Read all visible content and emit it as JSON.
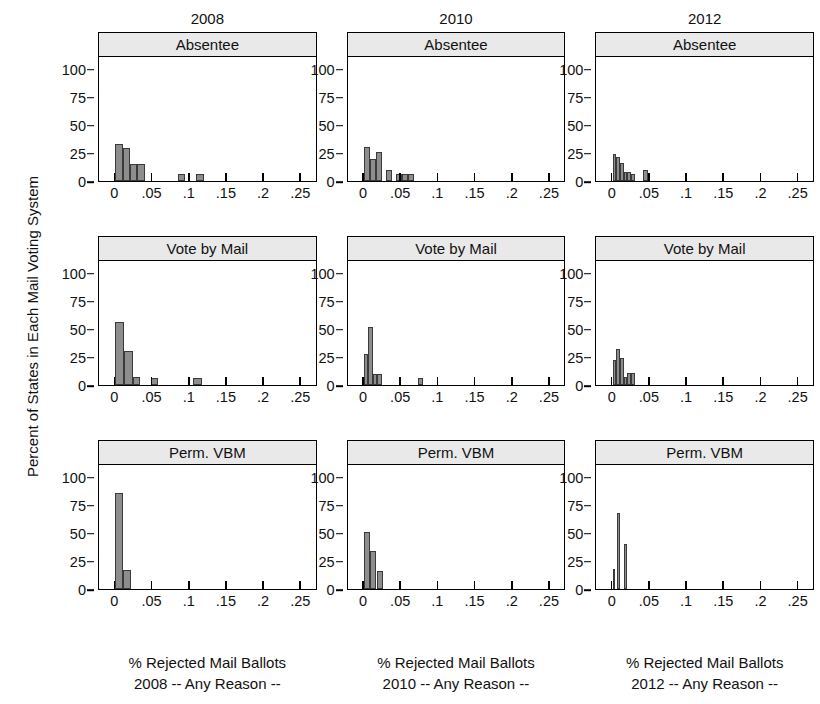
{
  "figure": {
    "ylabel": "Percent of States in Each Mail Voting System",
    "column_titles": [
      "2008",
      "2010",
      "2012"
    ],
    "row_titles": [
      "Absentee",
      "Vote by Mail",
      "Perm. VBM"
    ],
    "x_caption_line1": "% Rejected Mail Ballots",
    "x_captions_line2": [
      "2008 -- Any Reason --",
      "2010 -- Any Reason --",
      "2012 -- Any Reason --"
    ],
    "colors": {
      "bar_fill": "#8d8d8d",
      "bar_edge": "#3a3a3a",
      "strip_fill": "#e9e9e9",
      "axis": "#000000"
    }
  },
  "chart_data": [
    {
      "type": "bar",
      "title": "Absentee",
      "column": "2008",
      "xlabel": "% Rejected Mail Ballots 2008 -- Any Reason --",
      "ylabel": "Percent of States in Each Mail Voting System",
      "xlim": [
        -0.022,
        0.272
      ],
      "ylim": [
        0,
        112
      ],
      "xticks": [
        0,
        0.05,
        0.1,
        0.15,
        0.2,
        0.25
      ],
      "xticklabels": [
        "0",
        ".05",
        ".1",
        ".15",
        ".2",
        ".25"
      ],
      "yticks": [
        0,
        25,
        50,
        75,
        100
      ],
      "yticklabels": [
        "0",
        "25",
        "50",
        "75",
        "100"
      ],
      "grid": false,
      "bin_width": 0.01,
      "bins": [
        {
          "x0": 0.0,
          "x1": 0.01,
          "value": 33
        },
        {
          "x0": 0.01,
          "x1": 0.02,
          "value": 29
        },
        {
          "x0": 0.02,
          "x1": 0.03,
          "value": 15
        },
        {
          "x0": 0.03,
          "x1": 0.04,
          "value": 15
        },
        {
          "x0": 0.085,
          "x1": 0.095,
          "value": 6
        },
        {
          "x0": 0.11,
          "x1": 0.12,
          "value": 6
        }
      ]
    },
    {
      "type": "bar",
      "title": "Absentee",
      "column": "2010",
      "xlabel": "% Rejected Mail Ballots 2010 -- Any Reason --",
      "ylabel": "Percent of States in Each Mail Voting System",
      "xlim": [
        -0.022,
        0.272
      ],
      "ylim": [
        0,
        112
      ],
      "xticks": [
        0,
        0.05,
        0.1,
        0.15,
        0.2,
        0.25
      ],
      "xticklabels": [
        "0",
        ".05",
        ".1",
        ".15",
        ".2",
        ".25"
      ],
      "yticks": [
        0,
        25,
        50,
        75,
        100
      ],
      "yticklabels": [
        "0",
        "25",
        "50",
        "75",
        "100"
      ],
      "grid": false,
      "bin_width": 0.008,
      "bins": [
        {
          "x0": 0.0,
          "x1": 0.008,
          "value": 30
        },
        {
          "x0": 0.008,
          "x1": 0.016,
          "value": 20
        },
        {
          "x0": 0.016,
          "x1": 0.024,
          "value": 26
        },
        {
          "x0": 0.03,
          "x1": 0.038,
          "value": 10
        },
        {
          "x0": 0.044,
          "x1": 0.052,
          "value": 6
        },
        {
          "x0": 0.052,
          "x1": 0.06,
          "value": 6
        },
        {
          "x0": 0.06,
          "x1": 0.068,
          "value": 6
        }
      ]
    },
    {
      "type": "bar",
      "title": "Absentee",
      "column": "2012",
      "xlabel": "% Rejected Mail Ballots 2012 -- Any Reason --",
      "ylabel": "Percent of States in Each Mail Voting System",
      "xlim": [
        -0.022,
        0.272
      ],
      "ylim": [
        0,
        112
      ],
      "xticks": [
        0,
        0.05,
        0.1,
        0.15,
        0.2,
        0.25
      ],
      "xticklabels": [
        "0",
        ".05",
        ".1",
        ".15",
        ".2",
        ".25"
      ],
      "yticks": [
        0,
        25,
        50,
        75,
        100
      ],
      "yticklabels": [
        "0",
        "25",
        "50",
        "75",
        "100"
      ],
      "grid": false,
      "bin_width": 0.005,
      "bins": [
        {
          "x0": 0.0,
          "x1": 0.005,
          "value": 24
        },
        {
          "x0": 0.005,
          "x1": 0.01,
          "value": 21
        },
        {
          "x0": 0.01,
          "x1": 0.015,
          "value": 16
        },
        {
          "x0": 0.015,
          "x1": 0.02,
          "value": 8
        },
        {
          "x0": 0.02,
          "x1": 0.025,
          "value": 8
        },
        {
          "x0": 0.025,
          "x1": 0.03,
          "value": 6
        },
        {
          "x0": 0.042,
          "x1": 0.048,
          "value": 10
        }
      ]
    },
    {
      "type": "bar",
      "title": "Vote by Mail",
      "column": "2008",
      "xlabel": "% Rejected Mail Ballots 2008 -- Any Reason --",
      "ylabel": "Percent of States in Each Mail Voting System",
      "xlim": [
        -0.022,
        0.272
      ],
      "ylim": [
        0,
        112
      ],
      "xticks": [
        0,
        0.05,
        0.1,
        0.15,
        0.2,
        0.25
      ],
      "xticklabels": [
        "0",
        ".05",
        ".1",
        ".15",
        ".2",
        ".25"
      ],
      "yticks": [
        0,
        25,
        50,
        75,
        100
      ],
      "yticklabels": [
        "0",
        "25",
        "50",
        "75",
        "100"
      ],
      "grid": false,
      "bin_width": 0.012,
      "bins": [
        {
          "x0": 0.0,
          "x1": 0.012,
          "value": 56
        },
        {
          "x0": 0.012,
          "x1": 0.024,
          "value": 30
        },
        {
          "x0": 0.024,
          "x1": 0.034,
          "value": 7
        },
        {
          "x0": 0.048,
          "x1": 0.058,
          "value": 6
        },
        {
          "x0": 0.105,
          "x1": 0.118,
          "value": 6
        }
      ]
    },
    {
      "type": "bar",
      "title": "Vote by Mail",
      "column": "2010",
      "xlabel": "% Rejected Mail Ballots 2010 -- Any Reason --",
      "ylabel": "Percent of States in Each Mail Voting System",
      "xlim": [
        -0.022,
        0.272
      ],
      "ylim": [
        0,
        112
      ],
      "xticks": [
        0,
        0.05,
        0.1,
        0.15,
        0.2,
        0.25
      ],
      "xticklabels": [
        "0",
        ".05",
        ".1",
        ".15",
        ".2",
        ".25"
      ],
      "yticks": [
        0,
        25,
        50,
        75,
        100
      ],
      "yticklabels": [
        "0",
        "25",
        "50",
        "75",
        "100"
      ],
      "grid": false,
      "bin_width": 0.006,
      "bins": [
        {
          "x0": 0.0,
          "x1": 0.006,
          "value": 28
        },
        {
          "x0": 0.006,
          "x1": 0.012,
          "value": 52
        },
        {
          "x0": 0.012,
          "x1": 0.018,
          "value": 10
        },
        {
          "x0": 0.018,
          "x1": 0.024,
          "value": 10
        },
        {
          "x0": 0.074,
          "x1": 0.08,
          "value": 6
        }
      ]
    },
    {
      "type": "bar",
      "title": "Vote by Mail",
      "column": "2012",
      "xlabel": "% Rejected Mail Ballots 2012 -- Any Reason --",
      "ylabel": "Percent of States in Each Mail Voting System",
      "xlim": [
        -0.022,
        0.272
      ],
      "ylim": [
        0,
        112
      ],
      "xticks": [
        0,
        0.05,
        0.1,
        0.15,
        0.2,
        0.25
      ],
      "xticklabels": [
        "0",
        ".05",
        ".1",
        ".15",
        ".2",
        ".25"
      ],
      "yticks": [
        0,
        25,
        50,
        75,
        100
      ],
      "yticklabels": [
        "0",
        "25",
        "50",
        "75",
        "100"
      ],
      "grid": false,
      "bin_width": 0.005,
      "bins": [
        {
          "x0": 0.0,
          "x1": 0.005,
          "value": 22
        },
        {
          "x0": 0.005,
          "x1": 0.01,
          "value": 32
        },
        {
          "x0": 0.01,
          "x1": 0.015,
          "value": 24
        },
        {
          "x0": 0.015,
          "x1": 0.02,
          "value": 7
        },
        {
          "x0": 0.02,
          "x1": 0.025,
          "value": 11
        },
        {
          "x0": 0.025,
          "x1": 0.03,
          "value": 11
        }
      ]
    },
    {
      "type": "bar",
      "title": "Perm. VBM",
      "column": "2008",
      "xlabel": "% Rejected Mail Ballots 2008 -- Any Reason --",
      "ylabel": "Percent of States in Each Mail Voting System",
      "xlim": [
        -0.022,
        0.272
      ],
      "ylim": [
        0,
        112
      ],
      "xticks": [
        0,
        0.05,
        0.1,
        0.15,
        0.2,
        0.25
      ],
      "xticklabels": [
        "0",
        ".05",
        ".1",
        ".15",
        ".2",
        ".25"
      ],
      "yticks": [
        0,
        25,
        50,
        75,
        100
      ],
      "yticklabels": [
        "0",
        "25",
        "50",
        "75",
        "100"
      ],
      "grid": false,
      "bin_width": 0.011,
      "bins": [
        {
          "x0": 0.0,
          "x1": 0.011,
          "value": 85
        },
        {
          "x0": 0.011,
          "x1": 0.021,
          "value": 17
        }
      ]
    },
    {
      "type": "bar",
      "title": "Perm. VBM",
      "column": "2010",
      "xlabel": "% Rejected Mail Ballots 2010 -- Any Reason --",
      "ylabel": "Percent of States in Each Mail Voting System",
      "xlim": [
        -0.022,
        0.272
      ],
      "ylim": [
        0,
        112
      ],
      "xticks": [
        0,
        0.05,
        0.1,
        0.15,
        0.2,
        0.25
      ],
      "xticklabels": [
        "0",
        ".05",
        ".1",
        ".15",
        ".2",
        ".25"
      ],
      "yticks": [
        0,
        25,
        50,
        75,
        100
      ],
      "yticklabels": [
        "0",
        "25",
        "50",
        "75",
        "100"
      ],
      "grid": false,
      "bin_width": 0.008,
      "bins": [
        {
          "x0": 0.0,
          "x1": 0.008,
          "value": 51
        },
        {
          "x0": 0.008,
          "x1": 0.016,
          "value": 34
        },
        {
          "x0": 0.018,
          "x1": 0.026,
          "value": 16
        }
      ]
    },
    {
      "type": "bar",
      "title": "Perm. VBM",
      "column": "2012",
      "xlabel": "% Rejected Mail Ballots 2012 -- Any Reason --",
      "ylabel": "Percent of States in Each Mail Voting System",
      "xlim": [
        -0.022,
        0.272
      ],
      "ylim": [
        0,
        112
      ],
      "xticks": [
        0,
        0.05,
        0.1,
        0.15,
        0.2,
        0.25
      ],
      "xticklabels": [
        "0",
        ".05",
        ".1",
        ".15",
        ".2",
        ".25"
      ],
      "yticks": [
        0,
        25,
        50,
        75,
        100
      ],
      "yticklabels": [
        "0",
        "25",
        "50",
        "75",
        "100"
      ],
      "grid": false,
      "bin_width": 0.004,
      "bins": [
        {
          "x0": 0.0,
          "x1": 0.004,
          "value": 18
        },
        {
          "x0": 0.006,
          "x1": 0.01,
          "value": 68
        },
        {
          "x0": 0.016,
          "x1": 0.02,
          "value": 40
        }
      ]
    }
  ]
}
